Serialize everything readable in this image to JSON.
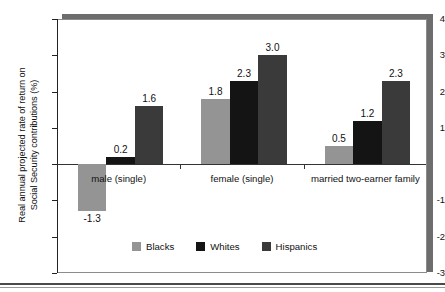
{
  "chart_data": {
    "type": "bar",
    "title": "",
    "xlabel": "",
    "ylabel_line1": "Real annual projected rate of return on",
    "ylabel_line2": "Social Security contributions (%)",
    "categories": [
      "male (single)",
      "female (single)",
      "married two-earner family"
    ],
    "series": [
      {
        "name": "Blacks",
        "color": "#949494",
        "values": [
          -1.3,
          1.8,
          0.5
        ]
      },
      {
        "name": "Whites",
        "color": "#141414",
        "values": [
          0.2,
          2.3,
          1.2
        ]
      },
      {
        "name": "Hispanics",
        "color": "#3a3a3a",
        "values": [
          1.6,
          3.0,
          2.3
        ]
      }
    ],
    "value_labels": [
      [
        "-1.3",
        "0.2",
        "1.6"
      ],
      [
        "1.8",
        "2.3",
        "3.0"
      ],
      [
        "0.5",
        "1.2",
        "2.3"
      ]
    ],
    "ylim": [
      -3,
      4
    ],
    "yticks": [
      4,
      3,
      2,
      1,
      0,
      -1,
      -2,
      -3
    ],
    "ytick_labels": [
      "4",
      "3",
      "2",
      "1",
      "",
      "-1",
      "-2",
      "-3"
    ],
    "grid": false,
    "legend_position": "bottom-center",
    "zero_line": true
  },
  "legend": {
    "items": [
      {
        "label": "Blacks",
        "color": "#949494"
      },
      {
        "label": "Whites",
        "color": "#141414"
      },
      {
        "label": "Hispanics",
        "color": "#3a3a3a"
      }
    ]
  },
  "frame": {
    "shadow_color": "#6d6d6d",
    "border_color": "#8c8c8c",
    "background": "#ffffff"
  }
}
